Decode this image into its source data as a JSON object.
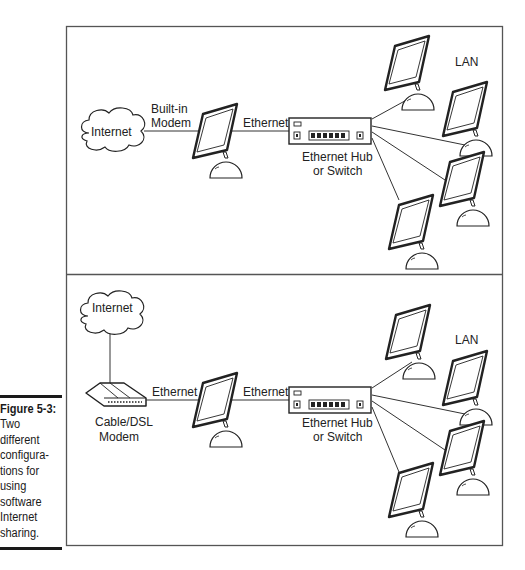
{
  "caption": {
    "label": "Figure 5-3:",
    "lines": [
      "Two",
      "different",
      "configura-",
      "tions for",
      "using",
      "software",
      "Internet",
      "sharing."
    ]
  },
  "panels": [
    {
      "internet_label": "Internet",
      "link1_label_line1": "Built-in",
      "link1_label_line2": "Modem",
      "link2_label": "Ethernet",
      "hub_label_line1": "Ethernet Hub",
      "hub_label_line2": "or Switch",
      "lan_label": "LAN"
    },
    {
      "internet_label": "Internet",
      "modem_label_line1": "Cable/DSL",
      "modem_label_line2": "Modem",
      "link1_label": "Ethernet",
      "link2_label": "Ethernet",
      "hub_label_line1": "Ethernet Hub",
      "hub_label_line2": "or Switch",
      "lan_label": "LAN"
    }
  ]
}
